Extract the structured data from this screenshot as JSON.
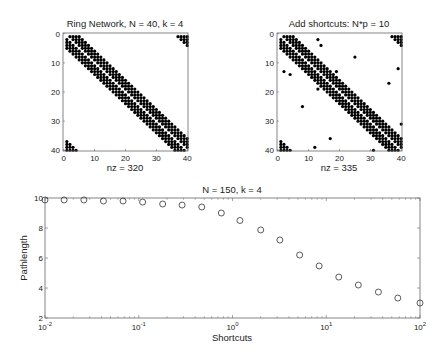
{
  "chart_data": [
    {
      "type": "heatmap",
      "subtype": "sparsity-pattern",
      "title": "Ring Network, N = 40, k =  4",
      "xlabel": "nz = 320",
      "ylabel": "",
      "xlim": [
        0,
        40
      ],
      "ylim": [
        0,
        40
      ],
      "xticks": [
        "0",
        "10",
        "20",
        "30",
        "40"
      ],
      "yticks": [
        "0",
        "10",
        "20",
        "30",
        "40"
      ],
      "N": 40,
      "k": 4,
      "nz": 320,
      "shortcuts": []
    },
    {
      "type": "heatmap",
      "subtype": "sparsity-pattern",
      "title": "Add shortcuts: N*p = 10",
      "xlabel": "nz = 335",
      "ylabel": "",
      "xlim": [
        0,
        40
      ],
      "ylim": [
        0,
        40
      ],
      "xticks": [
        "0",
        "10",
        "20",
        "30",
        "40"
      ],
      "yticks": [
        "0",
        "10",
        "20",
        "30",
        "40"
      ],
      "N": 40,
      "k": 4,
      "nz": 335,
      "shortcuts": [
        [
          13,
          2
        ],
        [
          14,
          4
        ],
        [
          25,
          8
        ],
        [
          39,
          12
        ],
        [
          2,
          13
        ],
        [
          4,
          14
        ],
        [
          19,
          13
        ],
        [
          36,
          17
        ],
        [
          13,
          19
        ],
        [
          8,
          25
        ],
        [
          40,
          31
        ],
        [
          17,
          36
        ],
        [
          12,
          39
        ],
        [
          31,
          40
        ]
      ]
    },
    {
      "type": "scatter",
      "title": "N = 150, k =  4",
      "xlabel": "Shortcuts",
      "ylabel": "Pathlength",
      "xscale": "log",
      "xlim": [
        0.01,
        100
      ],
      "ylim": [
        2,
        10
      ],
      "xticks": [
        "10^-2",
        "10^-1",
        "10^0",
        "10^1",
        "10^2"
      ],
      "yticks": [
        "2",
        "4",
        "6",
        "8",
        "10"
      ],
      "marker": "open-circle",
      "x": [
        0.01,
        0.016,
        0.026,
        0.042,
        0.068,
        0.11,
        0.18,
        0.29,
        0.47,
        0.76,
        1.2,
        2.0,
        3.2,
        5.2,
        8.4,
        13.6,
        22,
        36,
        58,
        100
      ],
      "y": [
        9.87,
        9.87,
        9.87,
        9.8,
        9.8,
        9.73,
        9.6,
        9.53,
        9.4,
        9.0,
        8.5,
        7.87,
        7.2,
        6.2,
        5.47,
        4.73,
        4.2,
        3.73,
        3.33,
        3.0
      ]
    }
  ]
}
